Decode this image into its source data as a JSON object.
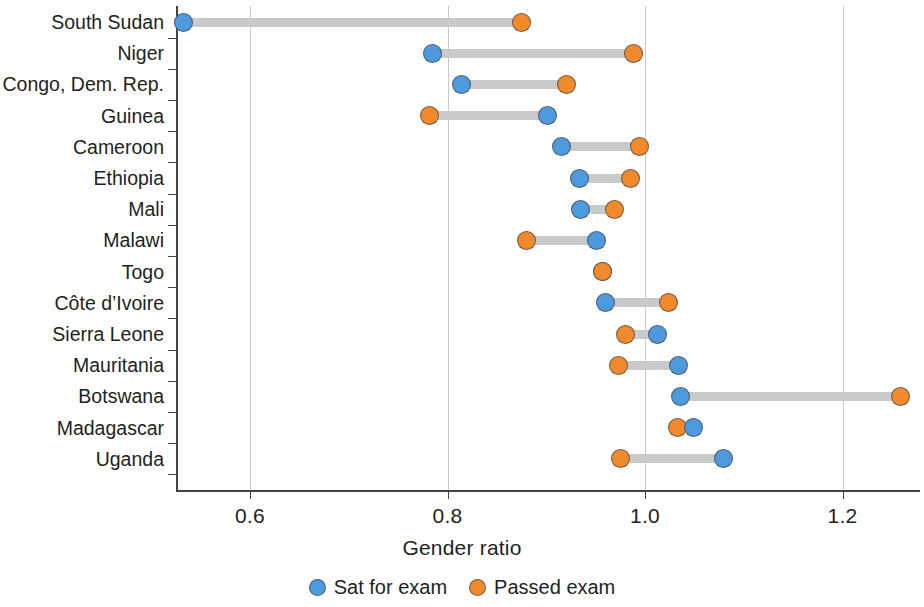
{
  "chart_data": {
    "type": "scatter",
    "subtype": "dumbbell",
    "title": "",
    "xlabel": "Gender ratio",
    "ylabel": "",
    "xlim": [
      0.51,
      1.31
    ],
    "xticks": [
      0.6,
      0.8,
      1.0,
      1.2
    ],
    "xtick_labels": [
      "0.6",
      "0.8",
      "1.0",
      "1.2"
    ],
    "grid": "vertical",
    "legend_position": "bottom-center",
    "categories": [
      "South Sudan",
      "Niger",
      "Congo, Dem. Rep.",
      "Guinea",
      "Cameroon",
      "Ethiopia",
      "Mali",
      "Malawi",
      "Togo",
      "Côte d’Ivoire",
      "Sierra Leone",
      "Mauritania",
      "Botswana",
      "Madagascar",
      "Uganda"
    ],
    "series": [
      {
        "name": "Sat for exam",
        "color": "#4d9ade",
        "values": [
          0.533,
          0.785,
          0.814,
          0.901,
          0.915,
          0.934,
          0.935,
          0.951,
          0.957,
          0.96,
          1.013,
          1.034,
          1.036,
          1.049,
          1.079
        ]
      },
      {
        "name": "Passed exam",
        "color": "#f08a2c",
        "values": [
          0.875,
          0.988,
          0.921,
          0.782,
          0.994,
          0.985,
          0.969,
          0.88,
          0.957,
          1.024,
          0.98,
          0.973,
          1.259,
          1.033,
          0.975
        ]
      }
    ],
    "connector_color": "#c9cacb",
    "axis_color": "#444444",
    "gridline_color": "#c9c9c9"
  },
  "legend": {
    "items": [
      {
        "label": "Sat for exam",
        "icon": "circle-blue-icon",
        "color": "#4d9ade"
      },
      {
        "label": "Passed exam",
        "icon": "circle-orange-icon",
        "color": "#f08a2c"
      }
    ]
  }
}
